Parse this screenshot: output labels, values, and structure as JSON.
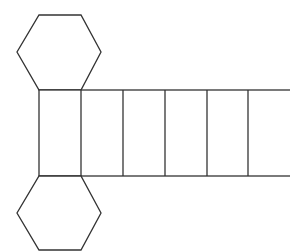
{
  "diagram": {
    "stroke_color": "#333333",
    "fill_color": "#ffffff",
    "background": "#ffffff",
    "top_hexagon": {
      "points": "39,15 81,15 101,52 81,90 39,90 17,52"
    },
    "rect_strip": {
      "x": 39,
      "y": 90,
      "width": 260,
      "height": 86,
      "face_count": 6,
      "dividers_x": [
        81,
        123,
        165,
        207,
        248
      ]
    },
    "bottom_hexagon": {
      "points": "39,176 81,176 101,213 81,250 39,250 17,213"
    }
  }
}
